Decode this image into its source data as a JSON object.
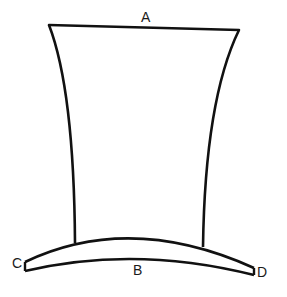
{
  "diagram": {
    "stroke_color": "#111111",
    "background": "#ffffff",
    "labels": {
      "A": "A",
      "B": "B",
      "C": "C",
      "D": "D"
    }
  }
}
